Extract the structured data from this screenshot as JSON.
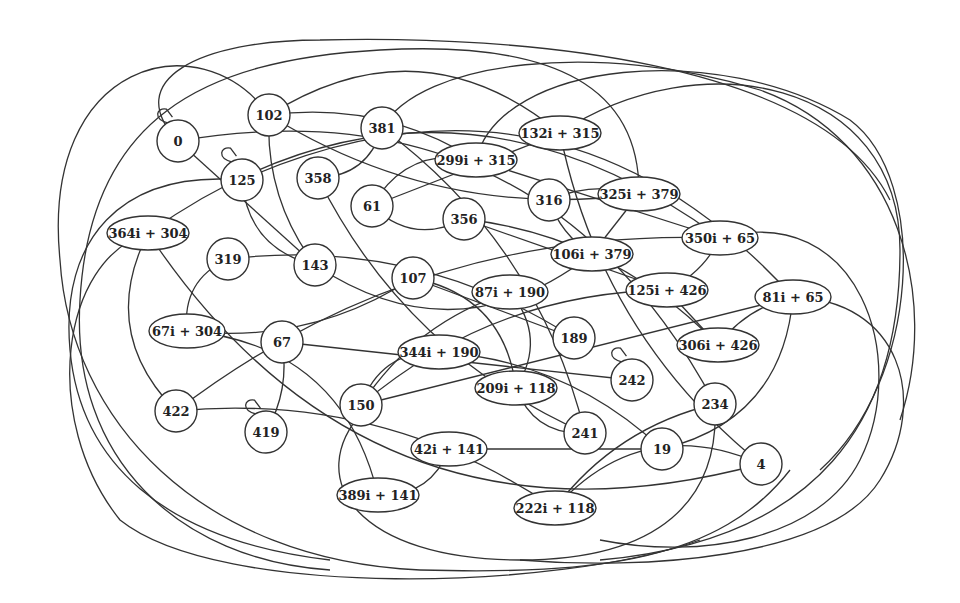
{
  "diagram": {
    "type": "graph",
    "colors": {
      "stroke": "#333333",
      "fill": "#ffffff",
      "text": "#222222"
    },
    "nodes": [
      {
        "id": "0",
        "label": "0",
        "shape": "circle",
        "self_loop": true
      },
      {
        "id": "102",
        "label": "102",
        "shape": "circle"
      },
      {
        "id": "381",
        "label": "381",
        "shape": "circle"
      },
      {
        "id": "125",
        "label": "125",
        "shape": "circle",
        "self_loop": true
      },
      {
        "id": "358",
        "label": "358",
        "shape": "circle"
      },
      {
        "id": "61",
        "label": "61",
        "shape": "circle"
      },
      {
        "id": "132i+315",
        "label": "132i + 315",
        "shape": "ellipse"
      },
      {
        "id": "299i+315",
        "label": "299i + 315",
        "shape": "ellipse"
      },
      {
        "id": "316",
        "label": "316",
        "shape": "circle"
      },
      {
        "id": "325i+379",
        "label": "325i + 379",
        "shape": "ellipse"
      },
      {
        "id": "356",
        "label": "356",
        "shape": "circle"
      },
      {
        "id": "364i+304",
        "label": "364i + 304",
        "shape": "ellipse"
      },
      {
        "id": "319",
        "label": "319",
        "shape": "circle"
      },
      {
        "id": "143",
        "label": "143",
        "shape": "circle"
      },
      {
        "id": "106i+379",
        "label": "106i + 379",
        "shape": "ellipse"
      },
      {
        "id": "350i+65",
        "label": "350i + 65",
        "shape": "ellipse"
      },
      {
        "id": "107",
        "label": "107",
        "shape": "circle"
      },
      {
        "id": "87i+190",
        "label": "87i + 190",
        "shape": "ellipse"
      },
      {
        "id": "125i+426",
        "label": "125i + 426",
        "shape": "ellipse"
      },
      {
        "id": "81i+65",
        "label": "81i + 65",
        "shape": "ellipse"
      },
      {
        "id": "67i+304",
        "label": "67i + 304",
        "shape": "ellipse"
      },
      {
        "id": "67",
        "label": "67",
        "shape": "circle"
      },
      {
        "id": "189",
        "label": "189",
        "shape": "circle"
      },
      {
        "id": "344i+190",
        "label": "344i + 190",
        "shape": "ellipse"
      },
      {
        "id": "306i+426",
        "label": "306i + 426",
        "shape": "ellipse"
      },
      {
        "id": "242",
        "label": "242",
        "shape": "circle",
        "self_loop": true
      },
      {
        "id": "209i+118",
        "label": "209i + 118",
        "shape": "ellipse"
      },
      {
        "id": "150",
        "label": "150",
        "shape": "circle"
      },
      {
        "id": "422",
        "label": "422",
        "shape": "circle"
      },
      {
        "id": "234",
        "label": "234",
        "shape": "circle"
      },
      {
        "id": "419",
        "label": "419",
        "shape": "circle",
        "self_loop": true
      },
      {
        "id": "241",
        "label": "241",
        "shape": "circle"
      },
      {
        "id": "42i+141",
        "label": "42i + 141",
        "shape": "ellipse"
      },
      {
        "id": "19",
        "label": "19",
        "shape": "circle"
      },
      {
        "id": "4",
        "label": "4",
        "shape": "circle"
      },
      {
        "id": "389i+141",
        "label": "389i + 141",
        "shape": "ellipse"
      },
      {
        "id": "222i+118",
        "label": "222i + 118",
        "shape": "ellipse"
      }
    ],
    "edges": [
      [
        "381",
        "358"
      ],
      [
        "316",
        "325i+379"
      ],
      [
        "325i+379",
        "106i+379"
      ],
      [
        "316",
        "106i+379"
      ],
      [
        "61",
        "356"
      ],
      [
        "61",
        "299i+315"
      ],
      [
        "350i+65",
        "125i+426"
      ],
      [
        "125i+426",
        "306i+426"
      ],
      [
        "81i+65",
        "306i+426"
      ],
      [
        "344i+190",
        "150"
      ],
      [
        "42i+141",
        "389i+141"
      ],
      [
        "67",
        "419"
      ],
      [
        "0",
        "143"
      ],
      [
        "102",
        "143"
      ],
      [
        "125",
        "143"
      ],
      [
        "364i+304",
        "350i+65"
      ],
      [
        "319",
        "189"
      ],
      [
        "107",
        "189"
      ],
      [
        "87i+190",
        "150"
      ],
      [
        "209i+118",
        "241"
      ],
      [
        "102",
        "132i+315"
      ],
      [
        "102",
        "299i+315"
      ],
      [
        "299i+315",
        "350i+65"
      ],
      [
        "132i+315",
        "4"
      ],
      [
        "364i+304",
        "422"
      ],
      [
        "67i+304",
        "389i+141"
      ],
      [
        "422",
        "222i+118"
      ],
      [
        "42i+141",
        "19"
      ],
      [
        "234",
        "222i+118"
      ],
      [
        "4",
        "222i+118"
      ],
      [
        "81i+65",
        "19"
      ],
      [
        "356",
        "306i+426"
      ],
      [
        "356",
        "125i+426"
      ],
      [
        "358",
        "241"
      ],
      [
        "143",
        "106i+379"
      ],
      [
        "87i+190",
        "209i+118"
      ],
      [
        "344i+190",
        "19"
      ],
      [
        "150",
        "81i+65"
      ],
      [
        "67i+304",
        "107"
      ],
      [
        "319",
        "67i+304"
      ],
      [
        "125",
        "81i+65"
      ],
      [
        "381",
        "241"
      ],
      [
        "61",
        "132i+315"
      ],
      [
        "102",
        "325i+379"
      ],
      [
        "364i+304",
        "4"
      ],
      [
        "0",
        "234"
      ],
      [
        "422",
        "350i+65"
      ],
      [
        "67",
        "242"
      ],
      [
        "125i+426",
        "150"
      ],
      [
        "209i+118",
        "107"
      ]
    ]
  }
}
